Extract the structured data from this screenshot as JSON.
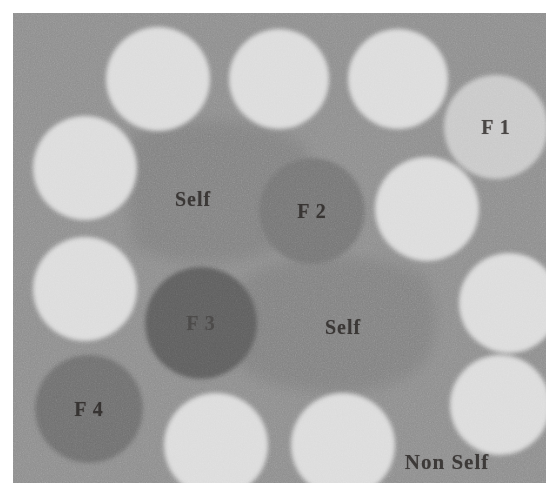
{
  "figure": {
    "canvas": {
      "x": 13,
      "y": 13,
      "width": 533,
      "height": 470
    },
    "colors": {
      "page_background": "#ffffff",
      "canvas_background": "#8e8e8e",
      "self_region": "#828282",
      "detector_light": "#dcdcdc",
      "detector_f1": "#c9c9c9",
      "detector_f2": "#767676",
      "detector_f3": "#5e5e5e",
      "detector_f4": "#6f6f6f",
      "label_text": "#25211f"
    }
  },
  "self_regions": [
    {
      "id": "self-region-upper-left",
      "label": "Self",
      "fill": "#828282",
      "label_x": 180,
      "label_y": 186,
      "path": "M 120 120 Q 108 175 120 232 Q 150 252 205 250 Q 262 246 290 216 Q 306 176 292 132 Q 250 106 196 108 Q 146 110 120 120 Z"
    },
    {
      "id": "self-region-lower-right",
      "label": "Self",
      "fill": "#828282",
      "label_x": 330,
      "label_y": 314,
      "path": "M 228 268 Q 214 312 228 356 Q 268 382 330 380 Q 398 376 418 340 Q 430 296 412 262 Q 362 240 300 244 Q 250 248 228 268 Z"
    }
  ],
  "detectors": [
    {
      "id": "detector-top-1",
      "label": "",
      "cx": 145,
      "cy": 66,
      "r": 52,
      "fill": "#dcdcdc",
      "labeled": false
    },
    {
      "id": "detector-top-2",
      "label": "",
      "cx": 266,
      "cy": 66,
      "r": 50,
      "fill": "#dcdcdc",
      "labeled": false
    },
    {
      "id": "detector-top-3",
      "label": "",
      "cx": 385,
      "cy": 66,
      "r": 50,
      "fill": "#dcdcdc",
      "labeled": false
    },
    {
      "id": "detector-f1",
      "label": "F 1",
      "cx": 483,
      "cy": 114,
      "r": 52,
      "fill": "#c9c9c9",
      "labeled": true,
      "label_style": "mid"
    },
    {
      "id": "detector-left-1",
      "label": "",
      "cx": 72,
      "cy": 155,
      "r": 52,
      "fill": "#dcdcdc",
      "labeled": false
    },
    {
      "id": "detector-left-2",
      "label": "",
      "cx": 72,
      "cy": 276,
      "r": 52,
      "fill": "#dcdcdc",
      "labeled": false
    },
    {
      "id": "detector-right-1",
      "label": "",
      "cx": 414,
      "cy": 196,
      "r": 52,
      "fill": "#dcdcdc",
      "labeled": false
    },
    {
      "id": "detector-right-2",
      "label": "",
      "cx": 496,
      "cy": 290,
      "r": 50,
      "fill": "#dcdcdc",
      "labeled": false
    },
    {
      "id": "detector-right-3",
      "label": "",
      "cx": 487,
      "cy": 392,
      "r": 50,
      "fill": "#dcdcdc",
      "labeled": false
    },
    {
      "id": "detector-f2",
      "label": "F 2",
      "cx": 299,
      "cy": 198,
      "r": 53,
      "fill": "#767676",
      "labeled": true,
      "label_style": "mid"
    },
    {
      "id": "detector-f3",
      "label": "F 3",
      "cx": 188,
      "cy": 310,
      "r": 56,
      "fill": "#5e5e5e",
      "labeled": true,
      "label_style": "faint"
    },
    {
      "id": "detector-f4",
      "label": "F 4",
      "cx": 76,
      "cy": 396,
      "r": 54,
      "fill": "#6f6f6f",
      "labeled": true,
      "label_style": "mid"
    },
    {
      "id": "detector-bottom-1",
      "label": "",
      "cx": 203,
      "cy": 432,
      "r": 52,
      "fill": "#dcdcdc",
      "labeled": false
    },
    {
      "id": "detector-bottom-2",
      "label": "",
      "cx": 330,
      "cy": 432,
      "r": 52,
      "fill": "#dcdcdc",
      "labeled": false
    }
  ],
  "annotations": [
    {
      "id": "non-self-label",
      "label": "Non Self",
      "x": 434,
      "y": 449,
      "style": "nonself"
    }
  ]
}
